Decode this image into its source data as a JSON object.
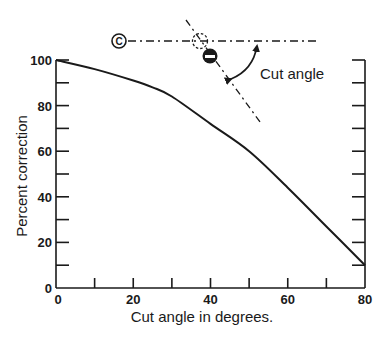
{
  "chart_data": {
    "type": "line",
    "title": "",
    "xlabel": "Cut angle in degrees.",
    "ylabel": "Percent correction",
    "xlim": [
      0,
      80
    ],
    "ylim": [
      0,
      100
    ],
    "x_ticks": [
      0,
      10,
      20,
      30,
      40,
      50,
      60,
      70,
      80
    ],
    "x_tick_labels": [
      "0",
      "20",
      "40",
      "60",
      "80"
    ],
    "x_tick_label_values": [
      0,
      20,
      40,
      60,
      80
    ],
    "y_ticks": [
      0,
      10,
      20,
      30,
      40,
      50,
      60,
      70,
      80,
      90,
      100
    ],
    "y_tick_labels": [
      "0",
      "20",
      "40",
      "60",
      "80",
      "100"
    ],
    "y_tick_label_values": [
      0,
      20,
      40,
      60,
      80,
      100
    ],
    "grid": false,
    "legend": null,
    "series": [
      {
        "name": "Percent correction",
        "x": [
          0,
          10,
          20,
          25,
          30,
          40,
          50,
          60,
          70,
          80
        ],
        "values": [
          100,
          96,
          91,
          88,
          84,
          72,
          60,
          44,
          27,
          10
        ]
      }
    ],
    "annotations": [
      {
        "type": "diagram",
        "label": "Cut angle",
        "description": "Cue ball (C) aimed along dashed line at ghost ball; object ball struck along dash-dot line; curved double arrow marks cut angle"
      }
    ]
  },
  "diagram": {
    "cue_ball_label": "C",
    "cut_angle_label": "Cut angle"
  },
  "colors": {
    "ink": "#1a1a1a",
    "background": "#ffffff"
  }
}
